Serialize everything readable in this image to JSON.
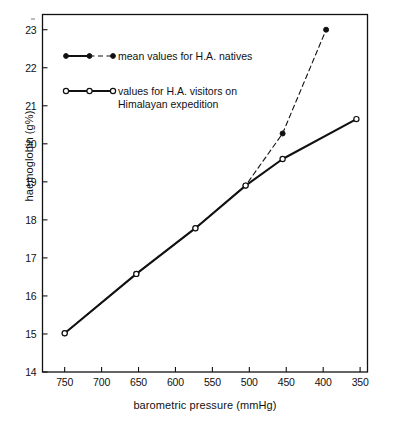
{
  "chart_data": {
    "type": "line",
    "title": "",
    "xlabel": "barometric pressure  (mmHg)",
    "ylabel": "haemoglobin (g%)",
    "xlim": [
      780,
      340
    ],
    "ylim": [
      14,
      23.4
    ],
    "x_reversed": true,
    "xticks": [
      750,
      700,
      650,
      600,
      550,
      500,
      450,
      400,
      350
    ],
    "yticks": [
      14,
      15,
      16,
      17,
      18,
      19,
      20,
      21,
      22,
      23
    ],
    "grid": false,
    "legend_position": "upper-left-inside",
    "series": [
      {
        "name": "mean values for H.A. natives",
        "marker": "filled-circle",
        "linestyle": "dashed",
        "color": "#111111",
        "points": [
          {
            "x": 750,
            "y": 15.02
          },
          {
            "x": 653,
            "y": 16.58
          },
          {
            "x": 573,
            "y": 17.78
          },
          {
            "x": 505,
            "y": 18.9
          },
          {
            "x": 455,
            "y": 20.27
          },
          {
            "x": 396,
            "y": 23.0
          }
        ]
      },
      {
        "name": "values for H.A. visitors on Himalayan expedition",
        "marker": "open-circle",
        "linestyle": "solid",
        "color": "#111111",
        "points": [
          {
            "x": 750,
            "y": 15.02
          },
          {
            "x": 653,
            "y": 16.58
          },
          {
            "x": 573,
            "y": 17.78
          },
          {
            "x": 505,
            "y": 18.9
          },
          {
            "x": 455,
            "y": 19.6
          },
          {
            "x": 355,
            "y": 20.65
          }
        ]
      }
    ]
  },
  "axes": {
    "ylabel": "haemoglobin (g%)",
    "xlabel": "barometric pressure  (mmHg)",
    "ytick_labels": [
      "23",
      "22",
      "21",
      "20",
      "19",
      "18",
      "17",
      "16",
      "15",
      "14"
    ],
    "xtick_labels": [
      "750",
      "700",
      "650",
      "600",
      "550",
      "500",
      "450",
      "400",
      "350"
    ]
  },
  "legend": {
    "entries": [
      {
        "line1": "mean values for H.A. natives",
        "line2": ""
      },
      {
        "line1": "values for H.A. visitors on",
        "line2": "Himalayan  expedition"
      }
    ]
  }
}
